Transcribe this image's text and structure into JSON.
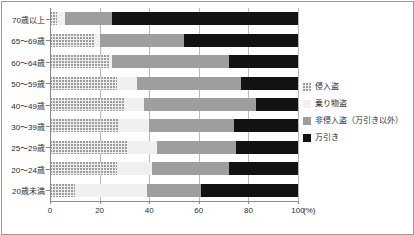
{
  "chart_data": {
    "type": "bar",
    "orientation": "horizontal",
    "stacked": true,
    "normalized": true,
    "title": "",
    "xlabel": "(%)",
    "ylabel": "",
    "xlim": [
      0,
      100
    ],
    "xticks": [
      0,
      20,
      40,
      60,
      80,
      100
    ],
    "xticklabels": [
      "0",
      "20",
      "40",
      "60",
      "80",
      "100"
    ],
    "unit": "(%)",
    "grid": "vertical",
    "legend_position": "right",
    "categories": [
      "70歳以上",
      "65〜69歳",
      "60〜64歳",
      "50〜59歳",
      "40〜49歳",
      "30〜39歳",
      "25〜29歳",
      "20〜24歳",
      "20歳未満"
    ],
    "series": [
      {
        "name": "侵入盗",
        "color": "#eeeeee",
        "pattern": "dotted",
        "values": [
          3,
          18,
          24,
          27,
          30,
          28,
          31,
          27,
          10
        ]
      },
      {
        "name": "乗り物盗",
        "color": "#f0f0f0",
        "pattern": "solid-light",
        "values": [
          3,
          2,
          1,
          8,
          8,
          12,
          12,
          14,
          29
        ]
      },
      {
        "name": "非侵入盗（万引き以外）",
        "color": "#9e9e9e",
        "pattern": "solid",
        "values": [
          19,
          34,
          47,
          42,
          45,
          34,
          32,
          31,
          22
        ]
      },
      {
        "name": "万引き",
        "color": "#121212",
        "pattern": "solid",
        "values": [
          75,
          46,
          28,
          23,
          17,
          26,
          25,
          28,
          39
        ]
      }
    ]
  },
  "legend": {
    "items": [
      {
        "label": "侵入盗"
      },
      {
        "label": "乗り物盗"
      },
      {
        "label": "非侵入盗（万引き以外）"
      },
      {
        "label": "万引き"
      }
    ]
  }
}
